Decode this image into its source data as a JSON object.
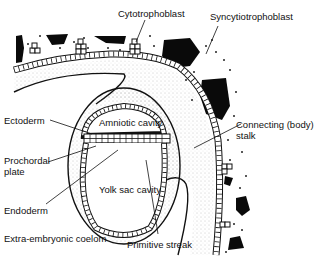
{
  "diagram": {
    "type": "anatomical illustration",
    "labels": {
      "cytotrophoblast": "Cytotrophoblast",
      "syncytiotrophoblast": "Syncytiotrophoblast",
      "ectoderm": "Ectoderm",
      "amniotic_cavity": "Amniotic cavity",
      "connecting_stalk_line1": "Connecting (body)",
      "connecting_stalk_line2": "stalk",
      "prochordal_line1": "Prochordal",
      "prochordal_line2": "plate",
      "yolk_sac_cavity": "Yolk sac cavity",
      "endoderm": "Endoderm",
      "extra_embryonic_coelom": "Extra-embryonic coelom",
      "primitive_streak": "Primitive streak"
    },
    "colors": {
      "ink": "#111111",
      "background": "#ffffff",
      "mesoderm_stipple": "#9a9a9a"
    }
  }
}
